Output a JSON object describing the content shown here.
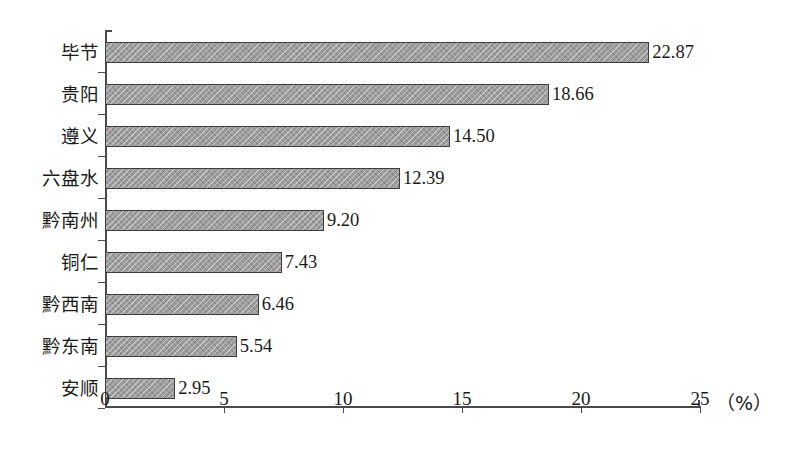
{
  "chart_data": {
    "type": "bar",
    "orientation": "horizontal",
    "title": "",
    "xlabel": "（%）",
    "ylabel": "",
    "xlim": [
      0,
      25
    ],
    "xticks": [
      0,
      5,
      10,
      15,
      20,
      25
    ],
    "xtick_labels": [
      "0",
      "5",
      "10",
      "15",
      "20",
      "25"
    ],
    "unit_label": "（%）",
    "grid": false,
    "legend": false,
    "categories": [
      "毕节",
      "贵阳",
      "遵义",
      "六盘水",
      "黔南州",
      "铜仁",
      "黔西南",
      "黔东南",
      "安顺"
    ],
    "values": [
      22.87,
      18.66,
      14.5,
      12.39,
      9.2,
      7.43,
      6.46,
      5.54,
      2.95
    ],
    "value_labels": [
      "22.87",
      "18.66",
      "14.50",
      "12.39",
      "9.20",
      "7.43",
      "6.46",
      "5.54",
      "2.95"
    ],
    "bar_fill_color": "#9d9d9d",
    "bar_edge_color": "#3d3d3d",
    "axis_color": "#4a4a4a",
    "background_color": "#ffffff"
  }
}
